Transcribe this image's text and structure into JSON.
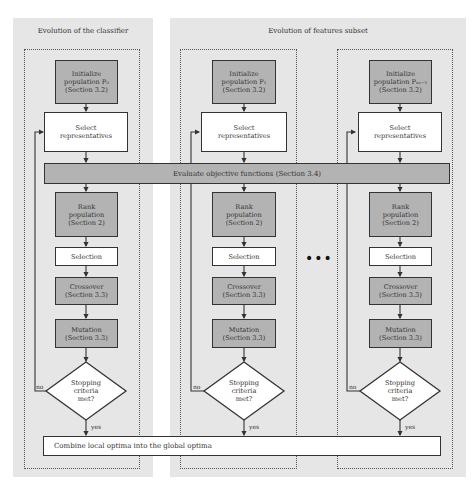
{
  "panels": {
    "classifier": {
      "title": "Evolution of the classifier"
    },
    "features": {
      "title": "Evolution of features subset"
    }
  },
  "columns": [
    {
      "init": "Initialize\npopulation P0\n(Section 3.2)",
      "init_lines": [
        "Initialize",
        "population P₀",
        "(Section 3.2)"
      ],
      "select": "Select\nrepresentatives",
      "rank": "Rank\npopulation\n(Section 2)",
      "selection": "Selection",
      "crossover": "Crossover\n(Section 3.3)",
      "mutation": "Mutation\n(Section 3.3)",
      "decision": "Stopping\ncriteria\nmet?",
      "no": "no",
      "yes": "yes"
    },
    {
      "init": "Initialize\npopulation P1\n(Section 3.2)",
      "init_lines": [
        "Initialize",
        "population P₁",
        "(Section 3.2)"
      ],
      "select": "Select\nrepresentatives",
      "rank": "Rank\npopulation\n(Section 2)",
      "selection": "Selection",
      "crossover": "Crossover\n(Section 3.3)",
      "mutation": "Mutation\n(Section 3.3)",
      "decision": "Stopping\ncriteria\nmet?",
      "no": "no",
      "yes": "yes"
    },
    {
      "init": "Initialize\npopulation P_{N_S-1}\n(Section 3.2)",
      "init_lines": [
        "Initialize",
        "population Pₙₛ₋₁",
        "(Section 3.2)"
      ],
      "select": "Select\nrepresentatives",
      "rank": "Rank\npopulation\n(Section 2)",
      "selection": "Selection",
      "crossover": "Crossover\n(Section 3.3)",
      "mutation": "Mutation\n(Section 3.3)",
      "decision": "Stopping\ncriteria\nmet?",
      "no": "no",
      "yes": "yes"
    }
  ],
  "evaluate_bar": "Evaluate objective functions (Section 3.4)",
  "combine_bar": "Combine local optima into the global optima",
  "ellipsis": "•••",
  "colors": {
    "panel_bg": "#e6e6e6",
    "process_gray": "#b3b3b3",
    "stroke": "#333333"
  }
}
